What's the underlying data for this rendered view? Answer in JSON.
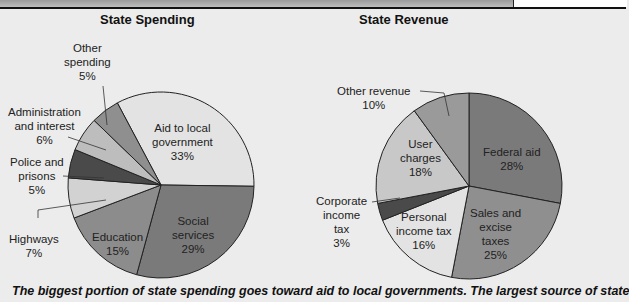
{
  "chart_data": [
    {
      "type": "pie",
      "title": "State Spending",
      "categories": [
        "Aid to local government",
        "Social services",
        "Education",
        "Highways",
        "Police and prisons",
        "Administration and interest",
        "Other spending"
      ],
      "values": [
        33,
        29,
        15,
        7,
        5,
        6,
        5
      ],
      "labels": [
        "Aid to local\ngovernment\n33%",
        "Social\nservices\n29%",
        "Education\n15%",
        "Highways\n7%",
        "Police and\nprisons\n5%",
        "Administration\nand interest\n6%",
        "Other\nspending\n5%"
      ],
      "colors": [
        "#e3e3e3",
        "#7a7a7a",
        "#8c8c8c",
        "#d2d2d2",
        "#4a4a4a",
        "#bdbdbd",
        "#8f8f8f"
      ]
    },
    {
      "type": "pie",
      "title": "State Revenue",
      "categories": [
        "Federal aid",
        "Sales and excise taxes",
        "Personal income tax",
        "Corporate income tax",
        "User charges",
        "Other revenue"
      ],
      "values": [
        28,
        25,
        16,
        3,
        18,
        10
      ],
      "labels": [
        "Federal aid\n28%",
        "Sales and\nexcise\ntaxes\n25%",
        "Personal\nincome tax\n16%",
        "Corporate\nincome\ntax\n3%",
        "User\ncharges\n18%",
        "Other revenue\n10%"
      ],
      "colors": [
        "#7a7a7a",
        "#8f8f8f",
        "#e3e3e3",
        "#4a4a4a",
        "#c8c8c8",
        "#9a9a9a"
      ]
    }
  ],
  "caption": "The biggest portion of state spending goes toward aid to local governments. The largest source of state"
}
